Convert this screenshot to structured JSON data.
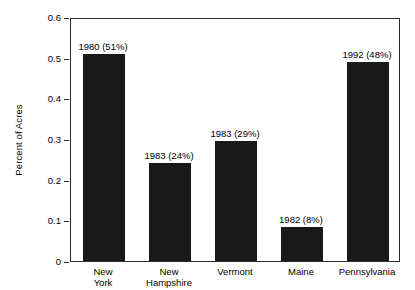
{
  "chart_data": {
    "type": "bar",
    "title": "",
    "subtitle": "",
    "xlabel": "",
    "ylabel": "Percent of Acres",
    "ylim": [
      0,
      0.6
    ],
    "ytick_labels": [
      "0",
      "0.1",
      "0.2",
      "0.3",
      "0.4",
      "0.5",
      "0.6"
    ],
    "ytick_values": [
      0,
      0.1,
      0.2,
      0.3,
      0.4,
      0.5,
      0.6
    ],
    "grid": false,
    "legend": "none",
    "bar_color": "#191919",
    "axis_color": "#2a2a2a",
    "categories": [
      "New York",
      "New Hampshire",
      "Vermont",
      "Maine",
      "Pennsylvania"
    ],
    "category_labels_wrapped": [
      "New\nYork",
      "New\nHampshire",
      "Vermont",
      "Maine",
      "Pennsylvania"
    ],
    "values": [
      0.51,
      0.24,
      0.295,
      0.083,
      0.49
    ],
    "annotations": [
      "1980 (51%)",
      "1983 (24%)",
      "1983 (29%)",
      "1982 (8%)",
      "1992 (48%)"
    ],
    "annotation_years": [
      1980,
      1983,
      1983,
      1982,
      1992
    ],
    "annotation_percents": [
      "51%",
      "24%",
      "29%",
      "8%",
      "48%"
    ]
  }
}
